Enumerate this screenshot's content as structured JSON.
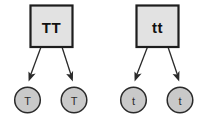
{
  "diagram": {
    "type": "genetics-gamete-diagram",
    "background_color": "#ffffff",
    "box_fill": "#e2e2e2",
    "box_stroke": "#1d1d1d",
    "circle_fill": "#c9c9c9",
    "circle_stroke": "#2a2a2a",
    "arrow_color": "#2a2a2a",
    "parents": [
      {
        "name": "parent-left",
        "genotype_label": "TT",
        "gametes": [
          {
            "name": "gamete-left-1",
            "label": "T"
          },
          {
            "name": "gamete-left-2",
            "label": "T"
          }
        ]
      },
      {
        "name": "parent-right",
        "genotype_label": "tt",
        "gametes": [
          {
            "name": "gamete-right-1",
            "label": "t"
          },
          {
            "name": "gamete-right-2",
            "label": "t"
          }
        ]
      }
    ]
  }
}
